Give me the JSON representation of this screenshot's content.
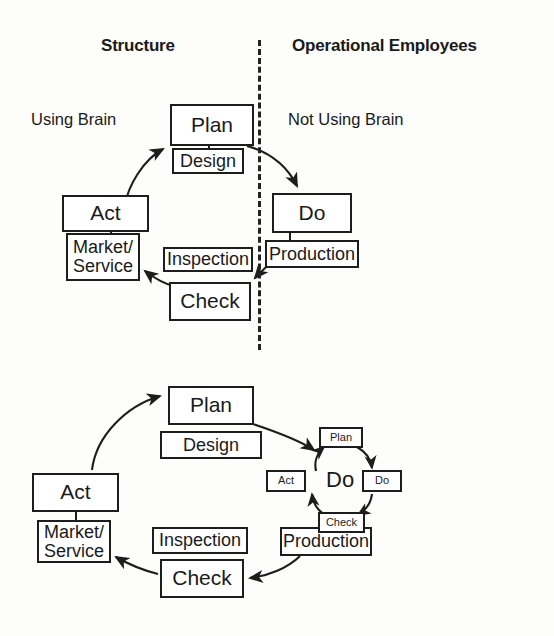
{
  "figure": {
    "title_hidden": "",
    "background_color": "#fdfdfc",
    "line_color": "#1d1d1d"
  },
  "top_diagram": {
    "headers": {
      "left": "Structure",
      "right": "Operational Employees"
    },
    "annotations": {
      "left": "Using Brain",
      "right": "Not Using Brain"
    },
    "divider": "vertical-dashed-line",
    "boxes": [
      {
        "id": "plan",
        "label": "Plan"
      },
      {
        "id": "design",
        "label": "Design"
      },
      {
        "id": "do",
        "label": "Do"
      },
      {
        "id": "production",
        "label": "Production"
      },
      {
        "id": "check",
        "label": "Check"
      },
      {
        "id": "inspection",
        "label": "Inspection"
      },
      {
        "id": "act",
        "label": "Act"
      },
      {
        "id": "market",
        "label": "Market/\nService"
      }
    ],
    "arrows": [
      {
        "from": "plan",
        "to": "do"
      },
      {
        "from": "do",
        "to": "check"
      },
      {
        "from": "check",
        "to": "act"
      },
      {
        "from": "act",
        "to": "plan"
      }
    ]
  },
  "bottom_diagram": {
    "boxes": [
      {
        "id": "plan",
        "label": "Plan"
      },
      {
        "id": "design",
        "label": "Design"
      },
      {
        "id": "production",
        "label": "Production"
      },
      {
        "id": "check",
        "label": "Check"
      },
      {
        "id": "inspection",
        "label": "Inspection"
      },
      {
        "id": "act",
        "label": "Act"
      },
      {
        "id": "market",
        "label": "Market/\nService"
      }
    ],
    "inner_cycle": {
      "center_label": "Do",
      "boxes": [
        {
          "id": "mini-plan",
          "label": "Plan"
        },
        {
          "id": "mini-do",
          "label": "Do"
        },
        {
          "id": "mini-check",
          "label": "Check"
        },
        {
          "id": "mini-act",
          "label": "Act"
        }
      ]
    },
    "arrows": [
      {
        "from": "act",
        "to": "plan"
      },
      {
        "from": "plan",
        "to": "mini-plan"
      },
      {
        "from": "production",
        "to": "check"
      },
      {
        "from": "check",
        "to": "market"
      },
      {
        "from": "mini-plan",
        "to": "mini-do"
      },
      {
        "from": "mini-do",
        "to": "mini-check"
      },
      {
        "from": "mini-check",
        "to": "mini-act"
      },
      {
        "from": "mini-act",
        "to": "mini-plan"
      }
    ]
  }
}
